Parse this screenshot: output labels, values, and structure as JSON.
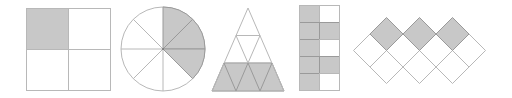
{
  "title": "Fraction shapes",
  "colors": {
    "stroke": "#b8b8b8",
    "shaded": "#c8c8c8",
    "shaded_stroke": "#999999",
    "unshaded": "#ffffff"
  },
  "shapes": [
    {
      "name": "square-2x2",
      "parts": 4,
      "shaded": 1,
      "fraction": "1/4"
    },
    {
      "name": "circle-8-sectors",
      "parts": 8,
      "shaded": 3,
      "fraction": "3/8"
    },
    {
      "name": "triangle-9-parts",
      "parts": 9,
      "shaded": 5,
      "fraction": "5/9"
    },
    {
      "name": "rectangle-2x5",
      "parts": 10,
      "shaded": 7,
      "fraction": "7/10"
    },
    {
      "name": "diamond-pattern",
      "parts": 10,
      "shaded": 3,
      "fraction": "3/10"
    }
  ]
}
